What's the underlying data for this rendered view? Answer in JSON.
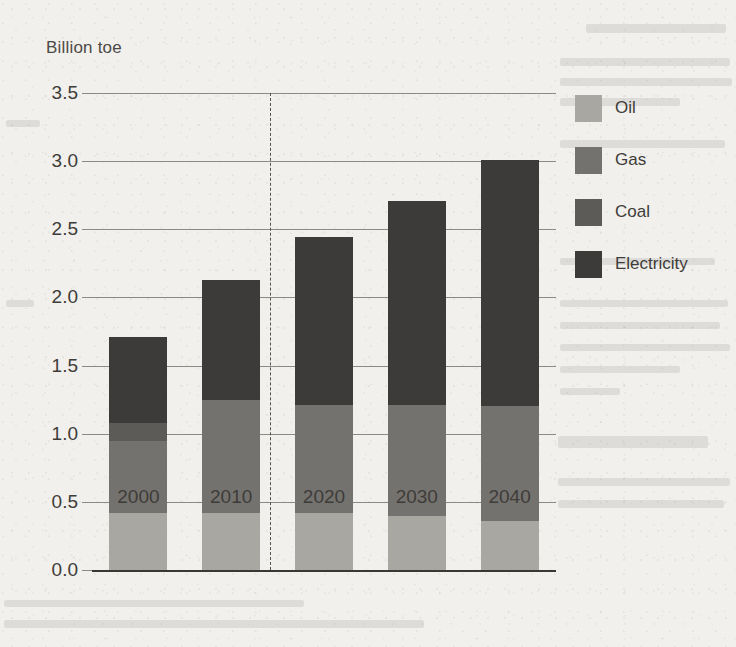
{
  "chart_data": {
    "type": "bar",
    "stacked": true,
    "title": "",
    "subtitle": "",
    "xlabel": "",
    "ylabel": "Billion toe",
    "categories": [
      "2000",
      "2010",
      "2020",
      "2030",
      "2040"
    ],
    "series": [
      {
        "name": "Oil",
        "color": "#a9a7a2",
        "values": [
          0.42,
          0.42,
          0.42,
          0.4,
          0.36
        ]
      },
      {
        "name": "Gas",
        "color": "#74726e",
        "values": [
          0.53,
          0.83,
          0.79,
          0.81,
          0.84
        ]
      },
      {
        "name": "Coal",
        "color": "#5d5b58",
        "values": [
          0.13,
          0.0,
          0.0,
          0.0,
          0.0
        ]
      },
      {
        "name": "Electricity",
        "color": "#3d3b39",
        "values": [
          0.63,
          0.88,
          1.23,
          1.5,
          1.81
        ]
      }
    ],
    "totals": [
      1.71,
      2.13,
      2.44,
      2.71,
      3.01
    ],
    "ylim": [
      0.0,
      3.5
    ],
    "yticks": [
      "0.0",
      "0.5",
      "1.0",
      "1.5",
      "2.0",
      "2.5",
      "3.0",
      "3.5"
    ],
    "ytick_values": [
      0.0,
      0.5,
      1.0,
      1.5,
      2.0,
      2.5,
      3.0,
      3.5
    ],
    "grid": true,
    "legend_position": "right",
    "annotations": [
      {
        "type": "vertical-dashed-line",
        "label": "",
        "between": [
          "2010",
          "2020"
        ]
      }
    ]
  },
  "legend": {
    "items": [
      {
        "label": "Oil",
        "color": "#a9a7a2"
      },
      {
        "label": "Gas",
        "color": "#74726e"
      },
      {
        "label": "Coal",
        "color": "#5d5b58"
      },
      {
        "label": "Electricity",
        "color": "#3d3b39"
      }
    ]
  }
}
